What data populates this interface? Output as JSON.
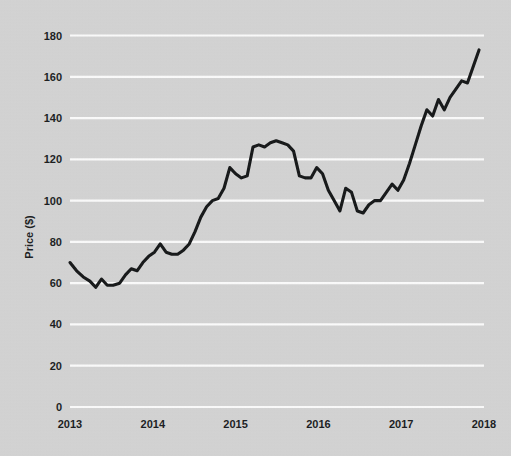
{
  "chart_data": {
    "type": "line",
    "title": "",
    "subtitle": "",
    "xlabel": "",
    "ylabel": "Price ($)",
    "xlim": [
      2013,
      2018
    ],
    "ylim": [
      0,
      190
    ],
    "grid": true,
    "legend": false,
    "legend_position": "none",
    "line_color": "#111314",
    "background_color": "#d4d4d4",
    "gridline_color": "#fdfdfd",
    "yticks": [
      0,
      20,
      40,
      60,
      80,
      100,
      120,
      140,
      160,
      180
    ],
    "ytick_labels": [
      "0",
      "20",
      "40",
      "60",
      "80",
      "100",
      "120",
      "140",
      "160",
      "180"
    ],
    "xticks": [
      2013,
      2014,
      2015,
      2016,
      2017,
      2018
    ],
    "xtick_labels": [
      "2013",
      "2014",
      "2015",
      "2016",
      "2017",
      "2018"
    ],
    "series": [
      {
        "name": "Price",
        "x": [
          2013.0,
          2013.08,
          2013.16,
          2013.24,
          2013.31,
          2013.38,
          2013.45,
          2013.52,
          2013.6,
          2013.67,
          2013.74,
          2013.81,
          2013.88,
          2013.95,
          2014.02,
          2014.09,
          2014.16,
          2014.23,
          2014.3,
          2014.37,
          2014.44,
          2014.51,
          2014.58,
          2014.65,
          2014.72,
          2014.79,
          2014.86,
          2014.93,
          2015.0,
          2015.07,
          2015.14,
          2015.21,
          2015.28,
          2015.35,
          2015.42,
          2015.49,
          2015.56,
          2015.63,
          2015.7,
          2015.77,
          2015.84,
          2015.91,
          2015.98,
          2016.05,
          2016.12,
          2016.19,
          2016.26,
          2016.33,
          2016.4,
          2016.47,
          2016.54,
          2016.61,
          2016.68,
          2016.75,
          2016.82,
          2016.89,
          2016.96,
          2017.03,
          2017.1,
          2017.17,
          2017.24,
          2017.31,
          2017.38,
          2017.45,
          2017.52,
          2017.59,
          2017.66,
          2017.73,
          2017.8,
          2017.87,
          2017.94
        ],
        "y": [
          70,
          66,
          63,
          61,
          58,
          62,
          59,
          59,
          60,
          64,
          67,
          66,
          70,
          73,
          75,
          79,
          75,
          74,
          74,
          76,
          79,
          85,
          92,
          97,
          100,
          101,
          106,
          116,
          113,
          111,
          112,
          126,
          127,
          126,
          128,
          129,
          128,
          127,
          124,
          112,
          111,
          111,
          116,
          113,
          105,
          100,
          95,
          106,
          104,
          95,
          94,
          98,
          100,
          100,
          104,
          108,
          105,
          110,
          118,
          127,
          136,
          144,
          141,
          149,
          144,
          150,
          154,
          158,
          157,
          165,
          173
        ]
      }
    ]
  },
  "axes": {
    "ylabel": "Price ($)"
  }
}
